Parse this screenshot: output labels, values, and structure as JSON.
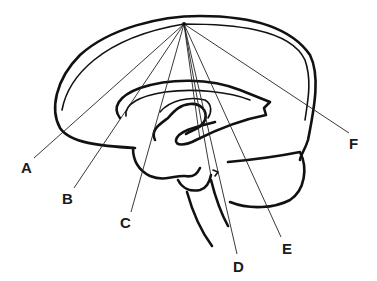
{
  "diagram": {
    "apex": {
      "x": 184,
      "y": 24
    },
    "labels": [
      {
        "text": "A",
        "x": 21,
        "y": 160,
        "line_end": {
          "x": 34,
          "y": 158
        }
      },
      {
        "text": "B",
        "x": 62,
        "y": 191,
        "line_end": {
          "x": 74,
          "y": 188
        }
      },
      {
        "text": "C",
        "x": 120,
        "y": 215,
        "line_end": {
          "x": 131,
          "y": 212
        }
      },
      {
        "text": "D",
        "x": 233,
        "y": 259,
        "line_end": {
          "x": 237,
          "y": 254
        }
      },
      {
        "text": "E",
        "x": 282,
        "y": 241,
        "line_end": {
          "x": 281,
          "y": 237
        }
      },
      {
        "text": "F",
        "x": 349,
        "y": 136,
        "line_end": {
          "x": 349,
          "y": 133
        }
      }
    ]
  }
}
